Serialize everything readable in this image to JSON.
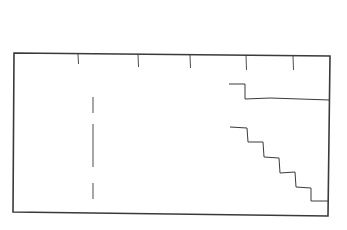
{
  "diagram": {
    "kind": "hand-drawn floor plan sketch",
    "background": "#ffffff",
    "stroke_color": "#3a3a3a",
    "outline": {
      "points": [
        [
          14,
          53
        ],
        [
          330,
          56
        ],
        [
          328,
          216
        ],
        [
          13,
          212
        ]
      ]
    },
    "top_ticks": [
      {
        "x": 78,
        "y1": 54,
        "y2": 64
      },
      {
        "x": 138,
        "y1": 54,
        "y2": 67
      },
      {
        "x": 190,
        "y1": 55,
        "y2": 68
      },
      {
        "x": 246,
        "y1": 55,
        "y2": 70
      },
      {
        "x": 293,
        "y1": 56,
        "y2": 70
      }
    ],
    "dashed_divider": {
      "x": 93,
      "segments": [
        [
          97,
          113
        ],
        [
          124,
          167
        ],
        [
          183,
          199
        ]
      ]
    },
    "upper_step_line": {
      "points": [
        [
          229,
          84
        ],
        [
          245,
          84
        ],
        [
          245,
          99
        ],
        [
          270,
          98
        ],
        [
          300,
          99
        ],
        [
          330,
          100
        ]
      ]
    },
    "lower_staircase_line": {
      "points": [
        [
          230,
          127
        ],
        [
          247,
          128
        ],
        [
          248,
          142
        ],
        [
          263,
          142
        ],
        [
          264,
          157
        ],
        [
          279,
          158
        ],
        [
          280,
          173
        ],
        [
          295,
          172
        ],
        [
          296,
          187
        ],
        [
          311,
          188
        ],
        [
          311,
          201
        ],
        [
          328,
          201
        ]
      ]
    }
  }
}
